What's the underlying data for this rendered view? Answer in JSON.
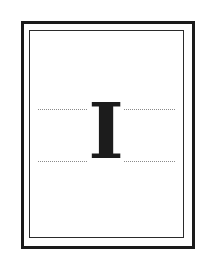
{
  "figure": {
    "glyph": "I",
    "colors": {
      "frame": "#1a1a1a",
      "guides": "#8a8a8a",
      "glyph": "#1c1c1c",
      "background": "#ffffff"
    }
  }
}
